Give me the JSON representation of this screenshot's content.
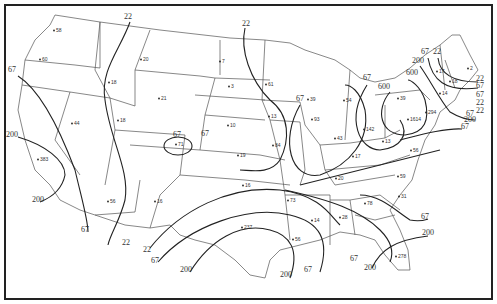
{
  "map": {
    "type": "contour map of contiguous United States",
    "border_color": "#222222",
    "background": "#ffffff",
    "contour_levels": [
      "22",
      "67",
      "200",
      "600"
    ],
    "contour_labels": [
      {
        "text": "22",
        "x": 128,
        "y": 19
      },
      {
        "text": "22",
        "x": 246,
        "y": 26
      },
      {
        "text": "67",
        "x": 12,
        "y": 72
      },
      {
        "text": "200",
        "x": 12,
        "y": 137
      },
      {
        "text": "200",
        "x": 38,
        "y": 202
      },
      {
        "text": "67",
        "x": 85,
        "y": 232
      },
      {
        "text": "22",
        "x": 126,
        "y": 245
      },
      {
        "text": "22",
        "x": 147,
        "y": 252
      },
      {
        "text": "67",
        "x": 155,
        "y": 263
      },
      {
        "text": "200",
        "x": 186,
        "y": 272
      },
      {
        "text": "200",
        "x": 286,
        "y": 277
      },
      {
        "text": "67",
        "x": 308,
        "y": 272
      },
      {
        "text": "67",
        "x": 354,
        "y": 261
      },
      {
        "text": "200",
        "x": 370,
        "y": 270
      },
      {
        "text": "67",
        "x": 425,
        "y": 219
      },
      {
        "text": "200",
        "x": 428,
        "y": 235
      },
      {
        "text": "67",
        "x": 367,
        "y": 80
      },
      {
        "text": "600",
        "x": 384,
        "y": 89
      },
      {
        "text": "600",
        "x": 412,
        "y": 75
      },
      {
        "text": "200",
        "x": 418,
        "y": 63
      },
      {
        "text": "67",
        "x": 425,
        "y": 54
      },
      {
        "text": "22",
        "x": 437,
        "y": 54
      },
      {
        "text": "22",
        "x": 480,
        "y": 81
      },
      {
        "text": "67",
        "x": 480,
        "y": 88
      },
      {
        "text": "67",
        "x": 480,
        "y": 97
      },
      {
        "text": "22",
        "x": 480,
        "y": 105
      },
      {
        "text": "22",
        "x": 480,
        "y": 113
      },
      {
        "text": "67",
        "x": 470,
        "y": 116
      },
      {
        "text": "200",
        "x": 470,
        "y": 122
      },
      {
        "text": "67",
        "x": 465,
        "y": 129
      },
      {
        "text": "67",
        "x": 300,
        "y": 101
      },
      {
        "text": "67",
        "x": 205,
        "y": 136
      }
    ],
    "station_values": [
      {
        "text": "58",
        "x": 56,
        "y": 32
      },
      {
        "text": "60",
        "x": 42,
        "y": 61
      },
      {
        "text": "20",
        "x": 143,
        "y": 61
      },
      {
        "text": "18",
        "x": 111,
        "y": 84
      },
      {
        "text": "21",
        "x": 161,
        "y": 100
      },
      {
        "text": "44",
        "x": 74,
        "y": 125
      },
      {
        "text": "18",
        "x": 120,
        "y": 122
      },
      {
        "text": "7",
        "x": 222,
        "y": 63
      },
      {
        "text": "3",
        "x": 231,
        "y": 88
      },
      {
        "text": "61",
        "x": 268,
        "y": 86
      },
      {
        "text": "39",
        "x": 310,
        "y": 101
      },
      {
        "text": "54",
        "x": 346,
        "y": 102
      },
      {
        "text": "13",
        "x": 271,
        "y": 118
      },
      {
        "text": "93",
        "x": 314,
        "y": 121
      },
      {
        "text": "10",
        "x": 230,
        "y": 127
      },
      {
        "text": "71",
        "x": 178,
        "y": 146
      },
      {
        "text": "84",
        "x": 275,
        "y": 147
      },
      {
        "text": "43",
        "x": 337,
        "y": 140
      },
      {
        "text": "142",
        "x": 366,
        "y": 131
      },
      {
        "text": "19",
        "x": 240,
        "y": 157
      },
      {
        "text": "16",
        "x": 245,
        "y": 187
      },
      {
        "text": "17",
        "x": 355,
        "y": 158
      },
      {
        "text": "13",
        "x": 385,
        "y": 143
      },
      {
        "text": "39",
        "x": 400,
        "y": 100
      },
      {
        "text": "1614",
        "x": 410,
        "y": 121
      },
      {
        "text": "294",
        "x": 428,
        "y": 114
      },
      {
        "text": "56",
        "x": 413,
        "y": 152
      },
      {
        "text": "20",
        "x": 338,
        "y": 180
      },
      {
        "text": "59",
        "x": 400,
        "y": 178
      },
      {
        "text": "383",
        "x": 40,
        "y": 161
      },
      {
        "text": "56",
        "x": 110,
        "y": 203
      },
      {
        "text": "16",
        "x": 157,
        "y": 203
      },
      {
        "text": "73",
        "x": 290,
        "y": 202
      },
      {
        "text": "31",
        "x": 401,
        "y": 198
      },
      {
        "text": "237",
        "x": 244,
        "y": 229
      },
      {
        "text": "14",
        "x": 314,
        "y": 222
      },
      {
        "text": "28",
        "x": 342,
        "y": 219
      },
      {
        "text": "78",
        "x": 367,
        "y": 205
      },
      {
        "text": "56",
        "x": 295,
        "y": 241
      },
      {
        "text": "278",
        "x": 398,
        "y": 258
      },
      {
        "text": "17",
        "x": 439,
        "y": 73
      },
      {
        "text": "18",
        "x": 452,
        "y": 83
      },
      {
        "text": "14",
        "x": 442,
        "y": 95
      },
      {
        "text": "2",
        "x": 470,
        "y": 70
      }
    ],
    "closed_region_label": {
      "text": "67",
      "x": 177,
      "y": 137
    }
  }
}
